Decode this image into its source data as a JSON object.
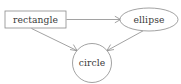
{
  "diagram": {
    "background_color": "#ffffff",
    "stroke_color": "#8a8a8a",
    "text_color": "#3a3a3a",
    "nodes": [
      {
        "id": "rectangle",
        "label": "rectangle",
        "shape": "rectangle",
        "cx": 35.5,
        "cy": 19.5,
        "width": 61,
        "height": 17
      },
      {
        "id": "ellipse",
        "label": "ellipse",
        "shape": "ellipse",
        "cx": 149,
        "cy": 19.5,
        "rx": 29,
        "ry": 11.5
      },
      {
        "id": "circle",
        "label": "circle",
        "shape": "circle",
        "cx": 92,
        "cy": 63,
        "r": 19.5
      }
    ],
    "edges": [
      {
        "id": "rectangle-to-ellipse",
        "from": "rectangle",
        "to": "ellipse",
        "directed": true,
        "label": ""
      },
      {
        "id": "rectangle-to-circle",
        "from": "rectangle",
        "to": "circle",
        "directed": true,
        "label": ""
      },
      {
        "id": "ellipse-to-circle",
        "from": "ellipse",
        "to": "circle",
        "directed": true,
        "label": ""
      }
    ]
  }
}
